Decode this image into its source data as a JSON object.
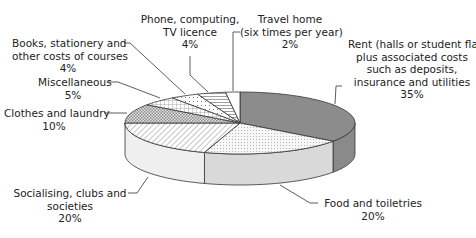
{
  "chart_data": {
    "type": "pie",
    "style": "3d-exploded-none",
    "title": "",
    "slices": [
      {
        "label": "Rent (halls or student flat) plus associated costs such as deposits, insurance and utilities",
        "value": 35,
        "fill": "#8c8c8c",
        "pattern": "solid-dark"
      },
      {
        "label": "Food and toiletries",
        "value": 20,
        "fill": "#f4f4f4",
        "pattern": "fine-dots"
      },
      {
        "label": "Socialising, clubs and societies",
        "value": 20,
        "fill": "#ffffff",
        "pattern": "diagonal-hatch"
      },
      {
        "label": "Clothes and laundry",
        "value": 10,
        "fill": "#d0d0d0",
        "pattern": "checker"
      },
      {
        "label": "Miscellaneous",
        "value": 5,
        "fill": "#ffffff",
        "pattern": "grid"
      },
      {
        "label": "Books, stationery and other costs of courses",
        "value": 4,
        "fill": "#ffffff",
        "pattern": "dots"
      },
      {
        "label": "Phone, computing, TV licence",
        "value": 4,
        "fill": "#ffffff",
        "pattern": "horizontal-lines"
      },
      {
        "label": "Travel home (six times per year)",
        "value": 2,
        "fill": "#ffffff",
        "pattern": "none"
      }
    ],
    "unit": "%",
    "legend": "none (leader-line callouts)"
  },
  "labels": {
    "rent": {
      "lines": [
        "Rent (halls or student flat)",
        "plus associated costs",
        "such as deposits,",
        "insurance and utilities"
      ],
      "pct": "35%"
    },
    "food": {
      "lines": [
        "Food and toiletries"
      ],
      "pct": "20%"
    },
    "social": {
      "lines": [
        "Socialising, clubs and",
        "societies"
      ],
      "pct": "20%"
    },
    "clothes": {
      "lines": [
        "Clothes and laundry"
      ],
      "pct": "10%"
    },
    "misc": {
      "lines": [
        "Miscellaneous"
      ],
      "pct": "5%"
    },
    "books": {
      "lines": [
        "Books, stationery and",
        "other costs of courses"
      ],
      "pct": "4%"
    },
    "phone": {
      "lines": [
        "Phone, computing,",
        "TV licence"
      ],
      "pct": "4%"
    },
    "travel": {
      "lines": [
        "Travel home",
        "(six times per year)"
      ],
      "pct": "2%"
    }
  }
}
